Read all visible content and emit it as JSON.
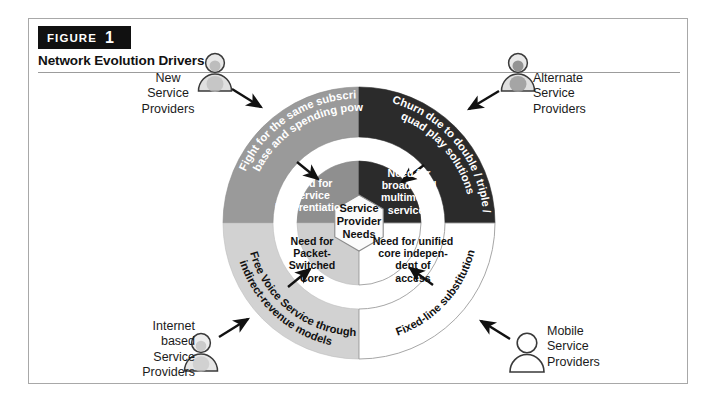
{
  "figure": {
    "badge_word": "FIGURE",
    "badge_number": "1",
    "title": "Network Evolution Drivers"
  },
  "center": {
    "label_line1": "Service",
    "label_line2": "Provider",
    "label_line3": "Needs"
  },
  "inner_ring": [
    {
      "id": "need-service-differentiation",
      "quadrant": "top-left",
      "lines": [
        "Need for",
        "Service",
        "Differentiation"
      ],
      "fill": "#8f8f8f",
      "text_color": "#ffffff"
    },
    {
      "id": "need-broadband-multimedia",
      "quadrant": "top-right",
      "lines": [
        "Need for",
        "broadband",
        "multimedia",
        "services"
      ],
      "fill": "#2b2b2b",
      "text_color": "#ffffff"
    },
    {
      "id": "need-packet-switched-core",
      "quadrant": "bottom-left",
      "lines": [
        "Need for",
        "Packet-",
        "Switched",
        "Core"
      ],
      "fill": "#cfcfcf",
      "text_color": "#111111"
    },
    {
      "id": "need-unified-core",
      "quadrant": "bottom-right",
      "lines": [
        "Need for unified",
        "core indepen-",
        "dent of",
        "access"
      ],
      "fill": "#ffffff",
      "text_color": "#111111"
    }
  ],
  "outer_ring": [
    {
      "id": "fight-same-subscriber-base",
      "quadrant": "top-left",
      "line1": "Fight for the same subscriber",
      "line2": "base and spending power",
      "fill": "#9a9a9a",
      "text_color": "#ffffff"
    },
    {
      "id": "churn-multi-play",
      "quadrant": "top-right",
      "line1": "Churn due to double / triple /",
      "line2": "quad play solutions",
      "fill": "#2b2b2b",
      "text_color": "#ffffff"
    },
    {
      "id": "free-voice-service",
      "quadrant": "bottom-left",
      "line1": "Free Voice Service through",
      "line2": "indirect-revenue models",
      "fill": "#d2d2d2",
      "text_color": "#111111"
    },
    {
      "id": "fixed-line-substitution",
      "quadrant": "bottom-right",
      "line1": "Fixed-line substitution",
      "line2": "",
      "fill": "#ffffff",
      "text_color": "#111111"
    }
  ],
  "actors": [
    {
      "id": "new-service-providers",
      "position": "top-left",
      "lines": [
        "New",
        "Service",
        "Providers"
      ],
      "icon": "person-icon"
    },
    {
      "id": "alternate-service-providers",
      "position": "top-right",
      "lines": [
        "Alternate",
        "Service",
        "Providers"
      ],
      "icon": "person-icon"
    },
    {
      "id": "internet-based-service-providers",
      "position": "bottom-left",
      "lines": [
        "Internet",
        "based",
        "Service",
        "Providers"
      ],
      "icon": "person-icon"
    },
    {
      "id": "mobile-service-providers",
      "position": "bottom-right",
      "lines": [
        "Mobile",
        "Service",
        "Providers"
      ],
      "icon": "person-icon"
    }
  ]
}
